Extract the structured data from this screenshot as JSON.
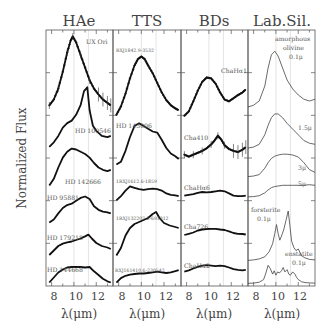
{
  "figure": {
    "ylabel": "Normalized Flux",
    "xlabel": "λ(μm)"
  },
  "chart_data": [
    {
      "type": "line",
      "title": "HAe",
      "xlabel": "λ(μm)",
      "ylabel": "Normalized Flux",
      "xlim": [
        7.5,
        13.5
      ],
      "xticks": [
        8,
        10,
        12
      ],
      "xtick_labels": [
        "8",
        "10",
        "12"
      ],
      "gridlines_x": [
        10,
        11.3
      ],
      "series": [
        {
          "name": "UX Ori",
          "style": "errorbar",
          "x": [
            7.8,
            8.2,
            8.6,
            9.0,
            9.4,
            9.7,
            9.9,
            10.2,
            10.6,
            11.0,
            11.4,
            11.8,
            12.2,
            12.6,
            13.0,
            13.3
          ],
          "y": [
            0.15,
            0.22,
            0.35,
            0.55,
            0.78,
            0.92,
            0.97,
            0.9,
            0.75,
            0.6,
            0.45,
            0.35,
            0.28,
            0.22,
            0.18,
            0.15
          ]
        },
        {
          "name": "HD 100546",
          "style": "line",
          "x": [
            7.8,
            8.2,
            8.6,
            9.0,
            9.4,
            9.8,
            10.2,
            10.6,
            10.9,
            11.2,
            11.4,
            11.7,
            12.0,
            12.5,
            13.0,
            13.3
          ],
          "y": [
            0.05,
            0.12,
            0.22,
            0.35,
            0.42,
            0.46,
            0.55,
            0.7,
            0.92,
            0.98,
            0.62,
            0.38,
            0.3,
            0.22,
            0.2,
            0.22
          ]
        },
        {
          "name": "HD 142666",
          "style": "line",
          "x": [
            7.8,
            8.2,
            8.6,
            9.0,
            9.4,
            9.8,
            10.2,
            10.6,
            11.0,
            11.4,
            11.8,
            12.2,
            12.6,
            13.0,
            13.3
          ],
          "y": [
            0.1,
            0.25,
            0.5,
            0.72,
            0.85,
            0.92,
            0.9,
            0.85,
            0.8,
            0.72,
            0.6,
            0.5,
            0.45,
            0.42,
            0.45
          ]
        },
        {
          "name": "HD 95881",
          "style": "line",
          "x": [
            7.8,
            8.2,
            8.6,
            9.0,
            9.4,
            9.8,
            10.2,
            10.6,
            11.0,
            11.4,
            11.8,
            12.2,
            12.6,
            13.0,
            13.3
          ],
          "y": [
            0.1,
            0.18,
            0.35,
            0.5,
            0.58,
            0.62,
            0.7,
            0.78,
            0.82,
            0.75,
            0.55,
            0.45,
            0.4,
            0.38,
            0.35
          ]
        },
        {
          "name": "HD 179218",
          "style": "line",
          "x": [
            7.8,
            8.2,
            8.6,
            9.0,
            9.4,
            9.8,
            10.2,
            10.6,
            11.0,
            11.3,
            11.6,
            12.0,
            12.5,
            13.0,
            13.3
          ],
          "y": [
            0.1,
            0.25,
            0.4,
            0.48,
            0.52,
            0.55,
            0.6,
            0.65,
            0.72,
            0.78,
            0.65,
            0.5,
            0.4,
            0.35,
            0.3
          ]
        },
        {
          "name": "HD 144668",
          "style": "line",
          "x": [
            7.8,
            8.2,
            8.6,
            9.0,
            9.4,
            9.8,
            10.2,
            10.6,
            11.0,
            11.4,
            11.8,
            12.2,
            12.6,
            13.0,
            13.3
          ],
          "y": [
            0.1,
            0.3,
            0.5,
            0.62,
            0.7,
            0.72,
            0.72,
            0.72,
            0.7,
            0.72,
            0.55,
            0.4,
            0.25,
            0.15,
            0.1
          ]
        }
      ]
    },
    {
      "type": "line",
      "title": "TTS",
      "xlabel": "λ(μm)",
      "xlim": [
        7.5,
        13.5
      ],
      "xticks": [
        8,
        10,
        12
      ],
      "xtick_labels": [
        "8",
        "10",
        "12"
      ],
      "gridlines_x": [
        10,
        11.3
      ],
      "series": [
        {
          "name": "RXJ1842.9-3532",
          "style": "markers",
          "x": [
            7.8,
            8.2,
            8.6,
            9.0,
            9.4,
            9.7,
            10.0,
            10.3,
            10.6,
            11.0,
            11.4,
            11.8,
            12.2,
            12.6,
            13.0,
            13.3
          ],
          "y": [
            0.05,
            0.18,
            0.38,
            0.62,
            0.82,
            0.92,
            0.96,
            0.92,
            0.82,
            0.7,
            0.55,
            0.4,
            0.28,
            0.2,
            0.15,
            0.12
          ]
        },
        {
          "name": "HD 143006",
          "style": "line",
          "x": [
            7.8,
            8.2,
            8.6,
            9.0,
            9.4,
            9.8,
            10.2,
            10.6,
            11.0,
            11.4,
            11.8,
            12.2,
            12.6,
            13.0,
            13.3
          ],
          "y": [
            0.1,
            0.15,
            0.35,
            0.6,
            0.8,
            0.85,
            0.8,
            0.75,
            0.7,
            0.68,
            0.55,
            0.4,
            0.3,
            0.25,
            0.2
          ]
        },
        {
          "name": "1RXJ1612.6-1859",
          "style": "line",
          "x": [
            7.8,
            8.2,
            8.6,
            9.0,
            9.4,
            9.8,
            10.2,
            10.6,
            11.0,
            11.4,
            11.8,
            12.2,
            12.6,
            13.0,
            13.3
          ],
          "y": [
            0.2,
            0.35,
            0.55,
            0.7,
            0.65,
            0.6,
            0.58,
            0.6,
            0.62,
            0.6,
            0.55,
            0.45,
            0.4,
            0.38,
            0.35
          ]
        },
        {
          "name": "1RXJ132207.2-693812",
          "style": "line",
          "x": [
            7.8,
            8.2,
            8.6,
            9.0,
            9.4,
            9.8,
            10.2,
            10.6,
            11.0,
            11.3,
            11.6,
            12.0,
            12.5,
            13.0,
            13.3
          ],
          "y": [
            0.05,
            0.2,
            0.45,
            0.6,
            0.68,
            0.72,
            0.76,
            0.8,
            0.88,
            0.92,
            0.8,
            0.7,
            0.65,
            0.62,
            0.6
          ]
        },
        {
          "name": "RXJ161410.6-230542",
          "style": "line",
          "x": [
            7.8,
            8.2,
            8.6,
            9.0,
            9.4,
            9.8,
            10.2,
            10.6,
            11.0,
            11.4,
            11.8,
            12.2,
            12.6,
            13.0,
            13.3
          ],
          "y": [
            0.1,
            0.3,
            0.4,
            0.45,
            0.48,
            0.5,
            0.5,
            0.52,
            0.55,
            0.58,
            0.55,
            0.52,
            0.55,
            0.6,
            0.65
          ]
        }
      ]
    },
    {
      "type": "line",
      "title": "BDs",
      "xlabel": "λ(μm)",
      "xlim": [
        7.5,
        13.5
      ],
      "xticks": [
        8,
        10,
        12
      ],
      "xtick_labels": [
        "8",
        "10",
        "12"
      ],
      "gridlines_x": [
        10,
        11.3
      ],
      "series": [
        {
          "name": "ChaHα1",
          "style": "markers",
          "x": [
            7.8,
            8.2,
            8.6,
            9.0,
            9.4,
            9.8,
            10.2,
            10.6,
            11.0,
            11.4,
            11.8,
            12.2,
            12.6,
            13.0,
            13.3
          ],
          "y": [
            0.05,
            0.15,
            0.38,
            0.62,
            0.82,
            0.92,
            0.9,
            0.78,
            0.58,
            0.42,
            0.38,
            0.45,
            0.52,
            0.58,
            0.65
          ]
        },
        {
          "name": "Cha410",
          "style": "errorbar",
          "x": [
            7.8,
            8.2,
            8.6,
            9.0,
            9.4,
            9.8,
            10.2,
            10.5,
            10.8,
            11.1,
            11.4,
            11.8,
            12.2,
            12.6,
            13.0,
            13.3
          ],
          "y": [
            0.35,
            0.3,
            0.35,
            0.4,
            0.45,
            0.52,
            0.62,
            0.72,
            0.85,
            0.75,
            0.6,
            0.5,
            0.45,
            0.42,
            0.48,
            0.55
          ]
        },
        {
          "name": "ChaHα6",
          "style": "line",
          "x": [
            7.8,
            8.2,
            8.6,
            9.0,
            9.4,
            9.8,
            10.2,
            10.6,
            11.0,
            11.4,
            11.8,
            12.2,
            12.6,
            13.0,
            13.3
          ],
          "y": [
            0.45,
            0.48,
            0.52,
            0.58,
            0.62,
            0.6,
            0.62,
            0.65,
            0.68,
            0.65,
            0.55,
            0.45,
            0.42,
            0.42,
            0.45
          ]
        },
        {
          "name": "Cha726",
          "style": "line",
          "x": [
            7.8,
            8.2,
            8.6,
            9.0,
            9.4,
            9.8,
            10.2,
            10.6,
            11.0,
            11.4,
            11.8,
            12.2,
            12.6,
            13.0,
            13.3
          ],
          "y": [
            0.4,
            0.45,
            0.5,
            0.58,
            0.62,
            0.64,
            0.65,
            0.65,
            0.62,
            0.6,
            0.55,
            0.48,
            0.45,
            0.44,
            0.42
          ]
        },
        {
          "name": "ChaHα2",
          "style": "line",
          "x": [
            7.8,
            8.2,
            8.6,
            9.0,
            9.4,
            9.8,
            10.2,
            10.6,
            11.0,
            11.4,
            11.8,
            12.2,
            12.6,
            13.0,
            13.3
          ],
          "y": [
            0.35,
            0.4,
            0.48,
            0.55,
            0.6,
            0.62,
            0.6,
            0.58,
            0.6,
            0.58,
            0.52,
            0.45,
            0.42,
            0.4,
            0.42
          ]
        }
      ]
    },
    {
      "type": "line",
      "title": "Lab.Sil.",
      "xlabel": "λ(μm)",
      "xlim": [
        7.5,
        13.5
      ],
      "xticks": [
        8,
        10,
        12
      ],
      "xtick_labels": [
        "8",
        "10",
        "12"
      ],
      "gridlines_x": [
        10,
        11.3
      ],
      "series": [
        {
          "name": "amorphous olivine 0.1μ",
          "style": "thin",
          "x": [
            7.5,
            8.0,
            8.5,
            9.0,
            9.3,
            9.6,
            9.9,
            10.2,
            10.6,
            11.0,
            11.5,
            12.0,
            12.5,
            13.0,
            13.5
          ],
          "y": [
            0.05,
            0.08,
            0.15,
            0.4,
            0.7,
            0.92,
            0.98,
            0.9,
            0.7,
            0.5,
            0.35,
            0.25,
            0.18,
            0.15,
            0.18
          ]
        },
        {
          "name": "1.5μ",
          "style": "thin",
          "x": [
            7.5,
            8.0,
            8.5,
            9.0,
            9.3,
            9.6,
            9.9,
            10.2,
            10.6,
            11.0,
            11.5,
            12.0,
            12.5,
            13.0,
            13.5
          ],
          "y": [
            0.05,
            0.08,
            0.15,
            0.4,
            0.65,
            0.85,
            0.95,
            0.95,
            0.85,
            0.7,
            0.55,
            0.4,
            0.25,
            0.18,
            0.15
          ]
        },
        {
          "name": "3μ",
          "style": "thin",
          "x": [
            7.5,
            8.0,
            8.5,
            9.0,
            9.3,
            9.6,
            9.9,
            10.2,
            10.6,
            11.0,
            11.5,
            12.0,
            12.5,
            13.0,
            13.5
          ],
          "y": [
            0.05,
            0.07,
            0.12,
            0.35,
            0.55,
            0.7,
            0.78,
            0.82,
            0.85,
            0.85,
            0.82,
            0.75,
            0.55,
            0.3,
            0.2
          ]
        },
        {
          "name": "5μ",
          "style": "thin",
          "x": [
            7.5,
            8.0,
            8.5,
            9.0,
            9.3,
            9.6,
            9.9,
            10.2,
            10.6,
            11.0,
            11.5,
            12.0,
            12.5,
            13.0,
            13.5
          ],
          "y": [
            0.05,
            0.06,
            0.1,
            0.22,
            0.35,
            0.45,
            0.5,
            0.52,
            0.55,
            0.55,
            0.55,
            0.55,
            0.55,
            0.58,
            0.55
          ]
        },
        {
          "name": "forsterite 0.1μ",
          "style": "thin",
          "x": [
            7.5,
            8.0,
            8.5,
            9.0,
            9.4,
            9.7,
            9.9,
            10.05,
            10.2,
            10.35,
            10.5,
            10.7,
            10.9,
            11.1,
            11.25,
            11.4,
            11.6,
            11.8,
            12.0,
            12.3,
            12.6,
            13.0,
            13.5
          ],
          "y": [
            0.03,
            0.04,
            0.06,
            0.1,
            0.2,
            0.35,
            0.55,
            0.72,
            0.55,
            0.42,
            0.5,
            0.62,
            0.8,
            0.98,
            0.7,
            0.4,
            0.28,
            0.22,
            0.25,
            0.12,
            0.08,
            0.05,
            0.04
          ]
        },
        {
          "name": "enstatite 0.1μ",
          "style": "thin",
          "x": [
            7.5,
            8.0,
            8.5,
            8.9,
            9.1,
            9.3,
            9.5,
            9.7,
            9.85,
            10.0,
            10.15,
            10.3,
            10.5,
            10.65,
            10.8,
            11.0,
            11.15,
            11.3,
            11.5,
            11.7,
            11.85,
            12.0,
            12.3,
            12.7,
            13.0,
            13.5
          ],
          "y": [
            0.03,
            0.04,
            0.08,
            0.2,
            0.5,
            0.85,
            0.7,
            0.45,
            0.6,
            0.4,
            0.55,
            0.5,
            0.6,
            0.75,
            0.55,
            0.65,
            0.45,
            0.4,
            0.55,
            0.45,
            0.3,
            0.2,
            0.1,
            0.06,
            0.05,
            0.04
          ]
        }
      ]
    }
  ],
  "panel_labels": [
    [
      "UX Ori",
      "HD 100546",
      "HD 142666",
      "HD 95881",
      "HD 179218",
      "HD 144668"
    ],
    [
      "RXJ1842.9-3532",
      "HD 143006",
      "1RXJ1612.6-1859",
      "1RXJ132207.2-693812",
      "RXJ161410.6-230542"
    ],
    [
      "ChaHα1",
      "Cha410",
      "ChaHα6",
      "Cha726",
      "ChaHα2"
    ],
    [
      "amorphous",
      "olivine",
      "0.1μ",
      "1.5μ",
      "3μ",
      "5μ",
      "forsterite",
      "0.1μ",
      "enstatite",
      "0.1μ"
    ]
  ]
}
